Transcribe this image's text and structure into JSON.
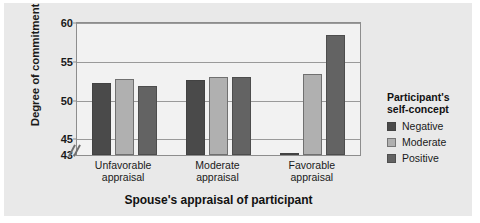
{
  "chart_data": {
    "type": "bar",
    "title": "",
    "subtitle": "",
    "xlabel": "Spouse's appraisal of participant",
    "ylabel": "Degree of commitment",
    "categories": [
      "Unfavorable appraisal",
      "Moderate appraisal",
      "Favorable appraisal"
    ],
    "category_lines": [
      [
        "Unfavorable",
        "appraisal"
      ],
      [
        "Moderate",
        "appraisal"
      ],
      [
        "Favorable",
        "appraisal"
      ]
    ],
    "series": [
      {
        "name": "Negative",
        "color": "#4a4a4a",
        "values": [
          52.3,
          52.6,
          43.3
        ]
      },
      {
        "name": "Moderate",
        "color": "#b0b0b0",
        "values": [
          52.8,
          53.0,
          53.4
        ]
      },
      {
        "name": "Positive",
        "color": "#636363",
        "values": [
          51.9,
          53.0,
          58.5
        ]
      }
    ],
    "ylim": [
      43,
      60
    ],
    "yticks": [
      43,
      45,
      50,
      55,
      60
    ],
    "ytick_labels": [
      "43",
      "45",
      "50",
      "55",
      "60"
    ],
    "axis_break": true,
    "grid": true,
    "legend_position": "right",
    "legend_title_lines": [
      "Participant's",
      "self-concept"
    ],
    "plot_background": "#f2f2f2",
    "panel_background": "#e9e9e9",
    "grid_color": "#9a9a9a",
    "frame_color": "#8d8d8d"
  }
}
